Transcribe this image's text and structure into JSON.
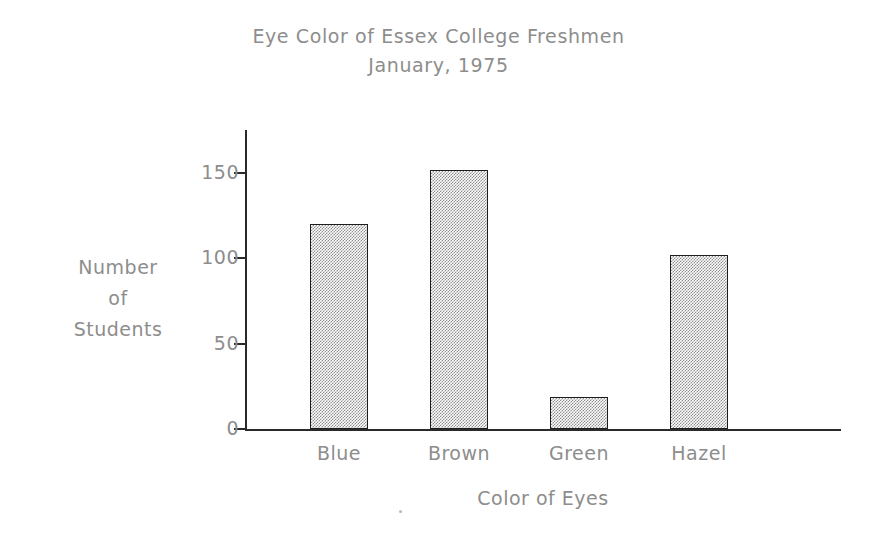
{
  "chart_data": {
    "type": "bar",
    "title": "Eye Color of Essex College Freshmen",
    "subtitle": "January, 1975",
    "xlabel": "Color of Eyes",
    "ylabel": "Number of Students",
    "ylabel_lines": [
      "Number",
      "of",
      "Students"
    ],
    "categories": [
      "Blue",
      "Brown",
      "Green",
      "Hazel"
    ],
    "values": [
      120,
      152,
      19,
      102
    ],
    "ylim": [
      0,
      160
    ],
    "yticks": [
      0,
      50,
      100,
      150
    ],
    "ytick_labels": [
      "0",
      "50",
      "100",
      "150"
    ],
    "grid": false,
    "legend": null,
    "bar_fill_color": "#8f8f8f",
    "bar_edge_color": "#1d1d1d",
    "axis_color": "#2a2a2a",
    "text_color": "#8d8d8d",
    "background_color": "#ffffff"
  }
}
